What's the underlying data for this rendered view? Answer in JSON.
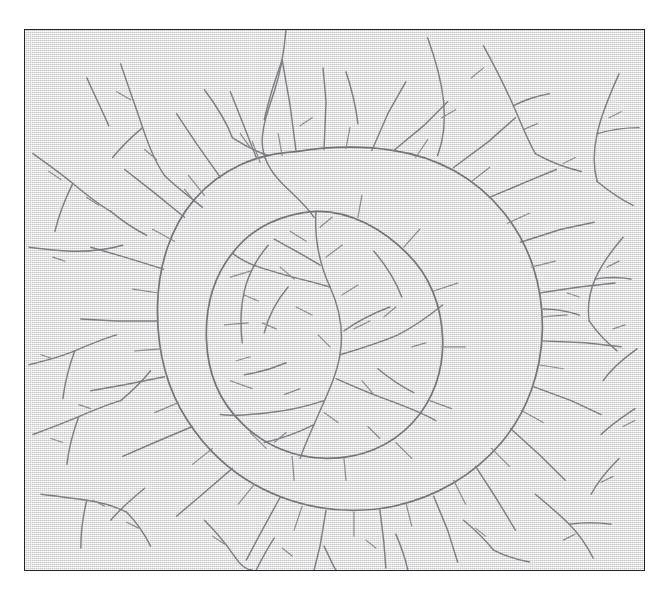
{
  "figure": {
    "title": "",
    "caption": "",
    "domain": "diagram"
  },
  "frame": {
    "x": 24,
    "y": 29,
    "width": 621,
    "height": 542,
    "border_color": "#23232a",
    "border_width_px": 1.5,
    "background_color": "#e9e9e9"
  },
  "style": {
    "paper_color": "#eaeaea",
    "line_color": "#7e7e84",
    "ring_line_color": "#74747a",
    "twig_line_color": "#8c8c92",
    "page_color": "#ffffff",
    "line_width_px": 1.45,
    "ring_line_width_px": 1.7,
    "twig_line_width_px": 1.2
  },
  "chart_data": {
    "type": "diagram",
    "title": "",
    "xlabel": "",
    "ylabel": "",
    "viewbox": [
      0,
      0,
      621,
      542
    ],
    "center": [
      292,
      292
    ],
    "outer_ring_radius": 182,
    "inner_ring_radius": 112
  },
  "network": {
    "outer_ring": [
      "M 272 122 C 232 124 196 140 170 170 C 146 198 134 236 133 276 C 132 318 141 358 163 392 C 188 431 224 458 266 472 C 300 483 336 485 370 478 C 412 469 450 447 478 414 C 504 383 518 343 519 302 C 520 258 507 216 480 183 C 452 148 412 127 370 121 C 338 116 304 117 272 122 Z"
    ],
    "inner_ring": [
      "M 292 182 C 258 184 228 198 208 224 C 189 248 181 279 182 310 C 183 343 195 373 218 395 C 241 418 272 430 303 430 C 336 430 367 418 389 394 C 410 371 420 341 419 310 C 418 277 406 246 383 224 C 360 201 327 181 292 182 Z"
    ],
    "radial_branches": [
      "M 272 122 L 266 76 L 258 30",
      "M 300 120 L 302 72 L 299 38",
      "M 348 121 L 364 84 L 382 52",
      "M 370 121 L 400 96 L 424 72",
      "M 430 138 L 465 112 L 492 88",
      "M 466 168 L 504 152 L 533 140",
      "M 497 213 L 538 200 L 571 193",
      "M 516 264 L 556 258 L 592 254",
      "M 519 312 L 562 314 L 598 318",
      "M 510 358 L 548 372 L 578 386",
      "M 487 400 L 518 428 L 542 452",
      "M 452 438 L 474 472 L 492 502",
      "M 410 468 L 424 502 L 434 534",
      "M 356 481 L 360 514 L 362 540",
      "M 302 482 L 296 518 L 290 542",
      "M 256 469 L 238 502 L 222 532",
      "M 208 440 L 178 466 L 152 488",
      "M 168 398 L 130 414 L 98 428",
      "M 140 348 L 100 356 L 66 362",
      "M 133 292 L 92 292 L 56 290",
      "M 139 240 L 100 228 L 66 218",
      "M 160 188 L 128 162 L 100 140",
      "M 196 148 L 172 114 L 152 84",
      "M 232 128 L 218 92 L 206 62"
    ],
    "ring_barbs": [
      "M 236 133 L 228 112",
      "M 258 126 L 254 104",
      "M 322 119 L 326 98",
      "M 392 128 L 404 110",
      "M 448 152 L 466 138",
      "M 484 194 L 506 184",
      "M 508 238 L 532 232",
      "M 519 288 L 544 286",
      "M 515 336 L 540 340",
      "M 498 382 L 520 394",
      "M 468 420 L 486 438",
      "M 430 452 L 442 476",
      "M 382 474 L 388 498",
      "M 330 484 L 330 508",
      "M 278 478 L 270 502",
      "M 230 456 L 214 476",
      "M 188 420 L 168 436",
      "M 154 374 L 130 384",
      "M 136 320 L 110 322",
      "M 134 264 L 108 260",
      "M 150 212 L 128 200",
      "M 180 166 L 164 146",
      "M 206 248 L 226 242",
      "M 200 296 L 224 294",
      "M 206 352 L 228 360",
      "M 226 404 L 242 420",
      "M 268 428 L 270 452",
      "M 320 430 L 322 452",
      "M 372 414 L 388 430",
      "M 406 372 L 428 380",
      "M 418 318 L 442 318",
      "M 410 262 L 434 254",
      "M 380 218 L 396 200",
      "M 334 188 L 338 166"
    ],
    "core_channels": [
      "M 292 182 C 290 210 296 236 306 258 C 316 280 320 302 316 326 C 312 350 300 372 290 396 C 282 414 278 424 276 430",
      "M 306 258 C 286 252 266 248 248 242 C 232 238 218 232 208 224",
      "M 316 326 C 336 320 356 314 374 306 C 390 298 404 288 419 276",
      "M 312 350 C 330 358 348 366 366 372 C 382 378 398 384 412 392",
      "M 300 372 C 282 378 264 382 246 384 C 228 386 210 388 196 386",
      "M 296 236 C 280 226 264 218 250 210",
      "M 320 302 C 334 292 350 284 366 278",
      "M 290 396 C 274 404 258 410 240 414",
      "M 244 216 C 232 230 224 246 220 262 C 216 280 216 298 218 314",
      "M 350 222 C 362 236 372 252 378 268",
      "M 264 258 C 252 272 244 288 240 304",
      "M 354 340 C 366 350 378 358 390 364",
      "M 262 334 C 248 340 234 344 220 346"
    ],
    "core_twigs": [
      "M 282 212 L 266 202",
      "M 302 228 L 318 216",
      "M 270 250 L 256 238",
      "M 318 266 L 334 256",
      "M 288 286 L 272 278",
      "M 330 300 L 346 292",
      "M 306 318 L 294 306",
      "M 338 352 L 350 366",
      "M 276 360 L 260 366",
      "M 300 384 L 314 394",
      "M 252 300 L 238 294",
      "M 234 272 L 220 266",
      "M 360 288 L 372 278",
      "M 388 318 L 402 314",
      "M 344 398 L 356 410",
      "M 262 404 L 250 414",
      "M 226 328 L 212 332",
      "M 296 198 L 308 188"
    ],
    "background_channels": [
      "M 262 -2 C 260 22 256 44 250 62 C 244 80 238 96 238 112 C 238 128 246 142 258 154 C 270 166 282 176 290 188",
      "M 258 30 C 250 52 244 72 240 90",
      "M 96 34 C 104 58 112 80 118 98 C 124 116 130 132 140 146",
      "M 140 146 C 152 158 166 168 178 178",
      "M 118 98 C 106 108 96 118 88 128",
      "M 404 8 C 412 30 418 52 420 72 C 422 92 420 110 414 126",
      "M 460 16 C 472 38 482 58 490 76 C 498 94 504 110 512 124",
      "M 512 124 C 526 132 542 138 558 142",
      "M 490 76 C 502 70 514 66 526 64",
      "M 596 44 C 586 66 578 86 574 104 C 570 122 570 138 574 152",
      "M 574 152 C 586 162 598 170 610 176",
      "M 574 104 C 588 100 602 98 616 98",
      "M 8 124 C 22 134 36 144 48 154 C 60 164 72 174 86 182",
      "M 86 182 C 98 192 110 200 122 206",
      "M 48 154 C 40 170 34 186 30 202",
      "M 4 218 C 20 220 36 222 52 222 C 68 222 84 220 98 216",
      "M 600 208 C 588 222 578 236 572 250 C 566 264 564 278 566 292",
      "M 566 292 C 574 304 584 314 594 322",
      "M 572 250 C 584 248 596 248 608 250",
      "M 556 286 C 544 282 532 280 520 280",
      "M 614 320 C 600 330 588 340 580 352",
      "M 4 336 C 20 332 36 328 50 322 C 64 316 78 310 92 306",
      "M 50 322 C 44 338 40 354 38 370",
      "M 8 406 C 24 400 40 394 54 388 C 68 382 82 376 96 372",
      "M 96 372 C 108 362 118 352 126 342",
      "M 54 388 C 48 404 44 420 42 436",
      "M 120 460 C 108 470 96 480 86 492",
      "M 16 466 C 32 468 48 470 62 472 C 76 474 90 478 102 484",
      "M 102 484 C 112 494 120 506 126 518",
      "M 62 472 C 58 488 56 504 56 520",
      "M 180 492 C 192 504 202 516 210 528 C 218 540 224 542 228 542",
      "M 250 510 C 242 522 236 534 232 542",
      "M 300 518 C 306 530 310 540 312 542",
      "M 372 506 C 378 520 382 532 384 542",
      "M 440 492 C 452 502 462 512 470 522",
      "M 470 522 C 482 528 494 532 506 534",
      "M 512 466 C 524 476 536 486 546 496 C 556 506 564 518 570 530",
      "M 546 496 C 560 494 574 494 588 496",
      "M 596 430 C 584 442 574 454 568 466",
      "M 612 380 C 600 388 588 396 578 406",
      "M 180 60 C 192 76 202 92 208 108",
      "M 208 108 C 220 116 232 122 244 126",
      "M 322 42 C 328 60 332 78 334 94",
      "M 62 48 C 70 66 78 82 84 96"
    ],
    "background_twigs": [
      "M 106 70 L 92 62",
      "M 132 130 L 120 120",
      "M 170 172 L 160 160",
      "M 226 118 L 216 104",
      "M 276 96 L 288 88",
      "M 418 88 L 432 80",
      "M 448 48 L 460 38",
      "M 500 100 L 514 94",
      "M 540 134 L 552 128",
      "M 586 88 L 598 82",
      "M 36 150 L 24 142",
      "M 74 176 L 62 168",
      "M 40 232 L 28 228",
      "M 584 238 L 596 232",
      "M 556 268 L 544 264",
      "M 590 300 L 602 296",
      "M 28 330 L 16 326",
      "M 66 380 L 54 376",
      "M 38 414 L 26 410",
      "M 80 478 L 68 472",
      "M 114 500 L 102 494",
      "M 200 516 L 188 508",
      "M 268 528 L 258 520",
      "M 352 520 L 342 512",
      "M 462 508 L 452 500",
      "M 540 512 L 552 506",
      "M 578 454 L 590 448",
      "M 600 398 L 612 392"
    ]
  }
}
